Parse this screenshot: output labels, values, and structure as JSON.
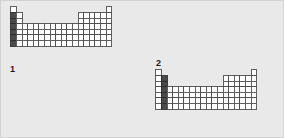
{
  "figure": {
    "background_color": "#e9e9e9",
    "border_color": "#d2d2d2",
    "width": 284,
    "height": 138
  },
  "style": {
    "cell_fill": "#ffffff",
    "cell_stroke": "#4d4d4d",
    "highlight_fill": "#4a4a4a",
    "highlight_stroke": "#2b2b2b",
    "cell_size": 5.6,
    "stroke_width": 0.9
  },
  "panels": [
    {
      "id": "panel-1",
      "label": "1",
      "label_position": "below-left",
      "highlight_group": 1,
      "highlight_description": "group 1 column shaded dark from period 2 through period 7",
      "highlight_cells": [
        {
          "group": 1,
          "period": 2
        },
        {
          "group": 1,
          "period": 3
        },
        {
          "group": 1,
          "period": 4
        },
        {
          "group": 1,
          "period": 5
        },
        {
          "group": 1,
          "period": 6
        },
        {
          "group": 1,
          "period": 7
        }
      ]
    },
    {
      "id": "panel-2",
      "label": "2",
      "label_position": "above-left",
      "highlight_group": 2,
      "highlight_description": "group 2 column shaded dark from period 2 through period 7",
      "highlight_cells": [
        {
          "group": 2,
          "period": 2
        },
        {
          "group": 2,
          "period": 3
        },
        {
          "group": 2,
          "period": 4
        },
        {
          "group": 2,
          "period": 5
        },
        {
          "group": 2,
          "period": 6
        },
        {
          "group": 2,
          "period": 7
        }
      ]
    }
  ],
  "periodic_table_shape": {
    "groups": 18,
    "periods": 7,
    "occupied_cells_by_period": {
      "1": [
        1,
        18
      ],
      "2": [
        1,
        2,
        13,
        14,
        15,
        16,
        17,
        18
      ],
      "3": [
        1,
        2,
        13,
        14,
        15,
        16,
        17,
        18
      ],
      "4": [
        1,
        2,
        3,
        4,
        5,
        6,
        7,
        8,
        9,
        10,
        11,
        12,
        13,
        14,
        15,
        16,
        17,
        18
      ],
      "5": [
        1,
        2,
        3,
        4,
        5,
        6,
        7,
        8,
        9,
        10,
        11,
        12,
        13,
        14,
        15,
        16,
        17,
        18
      ],
      "6": [
        1,
        2,
        3,
        4,
        5,
        6,
        7,
        8,
        9,
        10,
        11,
        12,
        13,
        14,
        15,
        16,
        17,
        18
      ],
      "7": [
        1,
        2,
        3,
        4,
        5,
        6,
        7,
        8,
        9,
        10,
        11,
        12,
        13,
        14,
        15,
        16,
        17,
        18
      ]
    }
  }
}
